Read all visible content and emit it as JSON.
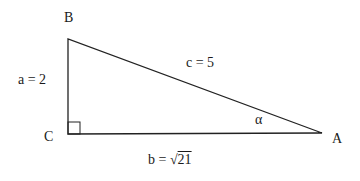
{
  "diagram": {
    "type": "right-triangle",
    "vertices": {
      "A": {
        "label": "A",
        "x": 322,
        "y": 133
      },
      "B": {
        "label": "B",
        "x": 68,
        "y": 39
      },
      "C": {
        "label": "C",
        "x": 68,
        "y": 134
      }
    },
    "sides": {
      "a": {
        "label": "a = 2"
      },
      "b": {
        "label_prefix": "b = ",
        "radical": "√",
        "radicand": "21"
      },
      "c": {
        "label": "c = 5"
      }
    },
    "angle": {
      "label": "α",
      "at": "A"
    },
    "right_angle_at": "C",
    "stroke_color": "#222222"
  }
}
